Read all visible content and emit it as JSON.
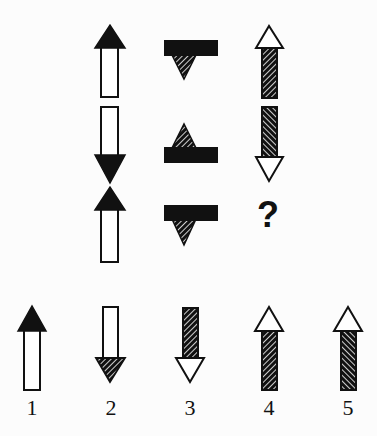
{
  "puzzle": {
    "type": "matrix-completion",
    "grid": {
      "rows": 3,
      "columns": 3,
      "cells": [
        [
          {
            "shape": "arrow",
            "direction": "up",
            "head_fill": "black",
            "shaft_fill": "white"
          },
          {
            "shape": "bar-with-triangle",
            "triangle_direction": "down",
            "bar_fill": "black",
            "triangle_fill": "hatched",
            "hatch": "/"
          },
          {
            "shape": "arrow",
            "direction": "up",
            "head_fill": "white",
            "shaft_fill": "hatched",
            "hatch": "/"
          }
        ],
        [
          {
            "shape": "arrow",
            "direction": "down",
            "head_fill": "black",
            "shaft_fill": "white"
          },
          {
            "shape": "bar-with-triangle",
            "triangle_direction": "up",
            "bar_fill": "black",
            "triangle_fill": "hatched",
            "hatch": "/"
          },
          {
            "shape": "arrow",
            "direction": "down",
            "head_fill": "white",
            "shaft_fill": "hatched",
            "hatch": "\\"
          }
        ],
        [
          {
            "shape": "arrow",
            "direction": "up",
            "head_fill": "black",
            "shaft_fill": "white"
          },
          {
            "shape": "bar-with-triangle",
            "triangle_direction": "down",
            "bar_fill": "black",
            "triangle_fill": "hatched",
            "hatch": "/"
          },
          {
            "shape": "missing",
            "symbol": "?"
          }
        ]
      ]
    },
    "missing_symbol": "?",
    "options": [
      {
        "label": "1",
        "shape": "arrow",
        "direction": "up",
        "head_fill": "black",
        "shaft_fill": "white"
      },
      {
        "label": "2",
        "shape": "arrow",
        "direction": "down",
        "head_fill": "hatched",
        "shaft_fill": "white",
        "hatch": "/"
      },
      {
        "label": "3",
        "shape": "arrow",
        "direction": "down",
        "head_fill": "white",
        "shaft_fill": "hatched",
        "hatch": "/"
      },
      {
        "label": "4",
        "shape": "arrow",
        "direction": "up",
        "head_fill": "white",
        "shaft_fill": "hatched",
        "hatch": "/"
      },
      {
        "label": "5",
        "shape": "arrow",
        "direction": "up",
        "head_fill": "white",
        "shaft_fill": "hatched",
        "hatch": "\\"
      }
    ],
    "colors": {
      "ink": "#111111",
      "background": "#fcfcfc"
    }
  }
}
